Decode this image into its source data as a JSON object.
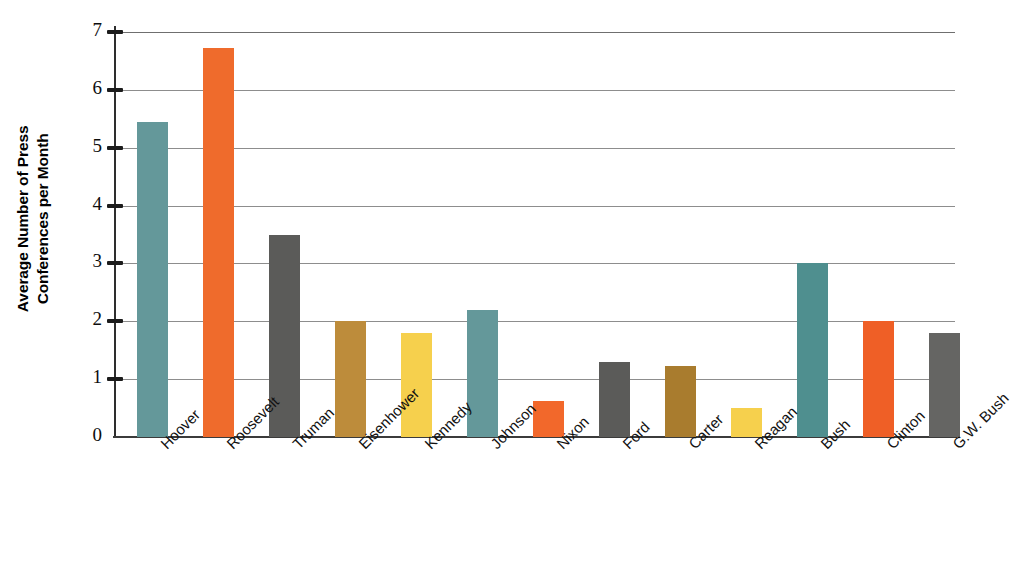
{
  "chart_data": {
    "type": "bar",
    "title": "",
    "xlabel": "",
    "ylabel": "Average Number of Press Conferences per Month",
    "ylabel_lines": [
      "Average Number of Press",
      "Conferences per Month"
    ],
    "categories": [
      "Hoover",
      "Roosevelt",
      "Truman",
      "Eisenhower",
      "Kennedy",
      "Johnson",
      "Nixon",
      "Ford",
      "Carter",
      "Reagan",
      "Bush",
      "Clinton",
      "G.W. Bush"
    ],
    "values": [
      5.45,
      6.72,
      3.5,
      2.0,
      1.8,
      2.2,
      0.63,
      1.3,
      1.22,
      0.5,
      3.0,
      2.0,
      1.8
    ],
    "bar_colors": [
      "#64989a",
      "#ef6b2c",
      "#5b5b59",
      "#bd8c3b",
      "#f6d04d",
      "#64989a",
      "#f2682b",
      "#5b5b59",
      "#a97c2e",
      "#f6d04d",
      "#4f8f8f",
      "#ef5f26",
      "#656563"
    ],
    "ylim": [
      0,
      7
    ],
    "ytick_labels": [
      "0",
      "1",
      "2",
      "3",
      "4",
      "5",
      "6",
      "7"
    ],
    "ytick_values": [
      0,
      1,
      2,
      3,
      4,
      5,
      6,
      7
    ],
    "grid": true,
    "grid_axis": "y",
    "legend": false,
    "legend_position": "none"
  },
  "colors": {
    "teal": "#64989a",
    "orange": "#ef6b2c",
    "gray": "#5b5b59",
    "ochre": "#bd8c3b",
    "yellow": "#f6d04d",
    "axis": "#2e2e2e",
    "grid": "#8d8d8d",
    "text": "#0d0d0d",
    "background": "#ffffff"
  }
}
